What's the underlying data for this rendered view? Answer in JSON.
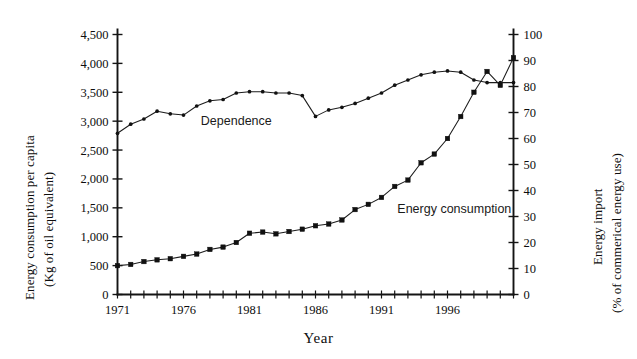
{
  "chart_data": {
    "type": "line",
    "title": "",
    "xlabel": "Year",
    "ylabel_left": "Energy consumption per capita",
    "ylabel_left_line2": "(Kg of oil equivalent)",
    "ylabel_right": "Energy import",
    "ylabel_right_line2": "(% of commerical energy use)",
    "grid": false,
    "legend_position": "inline-annotation",
    "x": [
      1971,
      1972,
      1973,
      1974,
      1975,
      1976,
      1977,
      1978,
      1979,
      1980,
      1981,
      1982,
      1983,
      1984,
      1985,
      1986,
      1987,
      1988,
      1989,
      1990,
      1991,
      1992,
      1993,
      1994,
      1995,
      1996,
      1997,
      1998,
      1999,
      2000,
      2001
    ],
    "xlim": [
      1971,
      2001
    ],
    "xticks_labeled": [
      "1971",
      "1976",
      "1981",
      "1986",
      "1991",
      "1996"
    ],
    "xticks_labeled_values": [
      1971,
      1976,
      1981,
      1986,
      1991,
      1996
    ],
    "xtick_interval": 1,
    "ylim_left": [
      0,
      4500
    ],
    "yticks_left": [
      "0",
      "500",
      "1,000",
      "1,500",
      "2,000",
      "2,500",
      "3,000",
      "3,500",
      "4,000",
      "4,500"
    ],
    "yticks_left_values": [
      0,
      500,
      1000,
      1500,
      2000,
      2500,
      3000,
      3500,
      4000,
      4500
    ],
    "ylim_right": [
      0,
      100
    ],
    "yticks_right": [
      "0",
      "10",
      "20",
      "30",
      "40",
      "50",
      "60",
      "70",
      "80",
      "90",
      "100"
    ],
    "yticks_right_values": [
      0,
      10,
      20,
      30,
      40,
      50,
      60,
      70,
      80,
      90,
      100
    ],
    "series": [
      {
        "name": "Dependence",
        "axis": "right",
        "unit": "% of commerical energy use",
        "marker": "small-dot",
        "annotation": "Dependence",
        "values": [
          62.0,
          65.5,
          67.5,
          70.5,
          69.5,
          69.0,
          72.5,
          74.5,
          75.0,
          77.5,
          78.0,
          78.0,
          77.5,
          77.5,
          76.5,
          68.5,
          71.0,
          72.0,
          73.5,
          75.5,
          77.5,
          80.5,
          82.5,
          84.5,
          85.5,
          86.0,
          85.5,
          82.5,
          81.5,
          81.5,
          81.5
        ]
      },
      {
        "name": "Energy consumption",
        "axis": "left",
        "unit": "Kg of oil equivalent",
        "marker": "square",
        "annotation": "Energy consumption",
        "values": [
          500,
          520,
          570,
          600,
          620,
          660,
          700,
          780,
          820,
          900,
          1060,
          1080,
          1050,
          1090,
          1130,
          1190,
          1220,
          1290,
          1470,
          1560,
          1680,
          1870,
          1980,
          2280,
          2430,
          2700,
          3080,
          3500,
          3860,
          3620,
          4100
        ]
      }
    ],
    "annotations": [
      {
        "text": "Dependence",
        "x": 1980,
        "y_right": 71
      },
      {
        "text": "Energy consumption",
        "x": 1992,
        "y_left": 1680
      }
    ]
  }
}
